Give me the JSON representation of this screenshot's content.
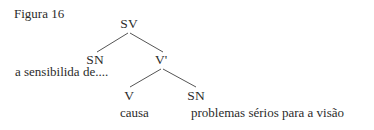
{
  "figure": {
    "caption": "Figura 16"
  },
  "tree": {
    "root": {
      "label": "SV"
    },
    "left_child": {
      "label": "SN",
      "text": "a sensibilida de...."
    },
    "right_child": {
      "label": "V'"
    },
    "right_left": {
      "label": "V",
      "text": "causa"
    },
    "right_right": {
      "label": "SN",
      "text": "problemas sérios para a visão"
    }
  },
  "colors": {
    "text": "#2b2b2b",
    "edges": "#555555",
    "background": "#ffffff"
  }
}
